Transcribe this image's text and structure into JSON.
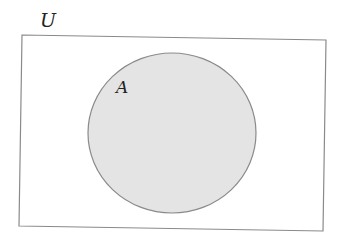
{
  "diagram": {
    "type": "venn",
    "universe_label": "U",
    "sets": [
      {
        "label": "A",
        "fill": "#e4e4e4",
        "stroke": "#8a8a8a"
      }
    ],
    "universe_stroke": "#8a8a8a",
    "background": "#ffffff"
  }
}
